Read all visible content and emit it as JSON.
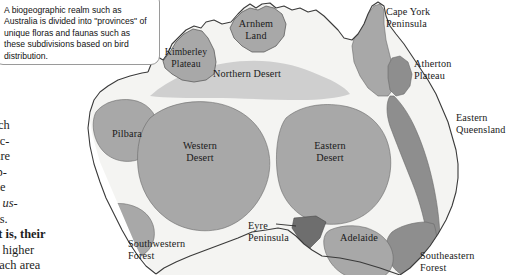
{
  "page": {
    "width": 513,
    "height": 275,
    "background": "#ffffff"
  },
  "callout": {
    "text": "A biogeographic realm such as Australia is divided into \"provinces\" of unique floras and faunas such as these subdivisions based on bird distribution.",
    "border_color": "#9a9a9a",
    "background": "#ffffff"
  },
  "body_text": {
    "lines": [
      "ecies, such",
      "to Palearc-",
      "species are",
      ", Neotrop-",
      "adillo, the",
      "illandsia  us-",
      "hern trees.",
      "ons; that is, their",
      "stributed higher",
      "time in each area"
    ],
    "italic_line_index": 5,
    "bold_line_index": 7
  },
  "map": {
    "title": "Australia biogeographic provinces",
    "colors": {
      "land": "#f4f4f2",
      "coastline": "#3a3a3a",
      "province_mid": "#a8a8a8",
      "province_light": "#cfcfcf",
      "province_dark": "#8e8e8e",
      "province_darkest": "#6e6e6e",
      "label_text": "#1a1a1a"
    },
    "labels": [
      {
        "name": "kimberley-plateau",
        "text": "Kimberley\nPlateau",
        "x": 186,
        "y": 52,
        "size": "sm",
        "align": "ctr"
      },
      {
        "name": "arnhem-land",
        "text": "Arnhem\nLand",
        "x": 256,
        "y": 20,
        "size": "md",
        "align": "ctr"
      },
      {
        "name": "northern-desert",
        "text": "Northern Desert",
        "x": 246,
        "y": 70,
        "size": "md",
        "align": "ctr"
      },
      {
        "name": "cape-york-peninsula",
        "text": "Cape York\nPeninsula",
        "x": 385,
        "y": 8,
        "size": "md",
        "align": "lft"
      },
      {
        "name": "atherton-plateau",
        "text": "Atherton\nPlateau",
        "x": 413,
        "y": 60,
        "size": "md",
        "align": "lft"
      },
      {
        "name": "eastern-queensland",
        "text": "Eastern\nQueensland",
        "x": 455,
        "y": 112,
        "size": "md",
        "align": "lft"
      },
      {
        "name": "pilbara",
        "text": "Pilbara",
        "x": 112,
        "y": 131,
        "size": "md",
        "align": "lft"
      },
      {
        "name": "western-desert",
        "text": "Western\nDesert",
        "x": 196,
        "y": 145,
        "size": "md",
        "align": "ctr"
      },
      {
        "name": "eastern-desert",
        "text": "Eastern\nDesert",
        "x": 326,
        "y": 145,
        "size": "md",
        "align": "ctr"
      },
      {
        "name": "southwestern-forest",
        "text": "Southwestern\nForest",
        "x": 130,
        "y": 240,
        "size": "md",
        "align": "lft"
      },
      {
        "name": "eyre-peninsula",
        "text": "Eyre\nPeninsula",
        "x": 252,
        "y": 225,
        "size": "md",
        "align": "lft"
      },
      {
        "name": "adelaide",
        "text": "Adelaide",
        "x": 342,
        "y": 236,
        "size": "md",
        "align": "lft"
      },
      {
        "name": "southeastern-forest",
        "text": "Southeastern\nForest",
        "x": 421,
        "y": 254,
        "size": "md",
        "align": "lft"
      }
    ],
    "provinces": [
      {
        "name": "kimberley-plateau",
        "shade": "mid"
      },
      {
        "name": "arnhem-land",
        "shade": "mid"
      },
      {
        "name": "northern-desert",
        "shade": "light"
      },
      {
        "name": "cape-york-peninsula",
        "shade": "mid"
      },
      {
        "name": "atherton-plateau",
        "shade": "dark"
      },
      {
        "name": "eastern-queensland",
        "shade": "dark"
      },
      {
        "name": "pilbara",
        "shade": "mid"
      },
      {
        "name": "western-desert",
        "shade": "mid"
      },
      {
        "name": "eastern-desert",
        "shade": "mid"
      },
      {
        "name": "southwestern-forest",
        "shade": "mid"
      },
      {
        "name": "eyre-peninsula",
        "shade": "darkest"
      },
      {
        "name": "adelaide",
        "shade": "mid"
      },
      {
        "name": "southeastern-forest",
        "shade": "dark"
      }
    ]
  }
}
